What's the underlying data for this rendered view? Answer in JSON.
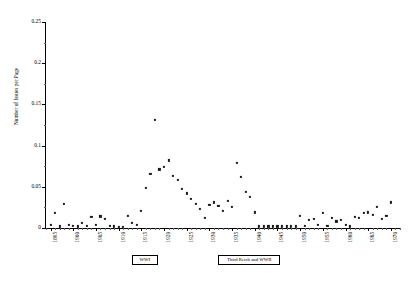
{
  "chart_data": {
    "type": "scatter",
    "title": "",
    "xlabel": "",
    "ylabel": "Number of Issues per Page",
    "xlim": [
      1894,
      1972
    ],
    "ylim": [
      0,
      0.25
    ],
    "grid": false,
    "legend": null,
    "y_ticks": [
      0,
      0.05,
      0.1,
      0.15,
      0.2,
      0.25
    ],
    "y_tick_labels": [
      "0",
      "0.05",
      "0.1",
      "0.15",
      "0.2",
      "0.25"
    ],
    "x_ticks": [
      1895,
      1900,
      1905,
      1910,
      1915,
      1920,
      1925,
      1930,
      1935,
      1940,
      1945,
      1950,
      1955,
      1960,
      1965,
      1970
    ],
    "x_tick_labels": [
      "1895",
      "1900",
      "1905",
      "1910",
      "1915",
      "1920",
      "1925",
      "1930",
      "1935",
      "1940",
      "1945",
      "1950",
      "1955",
      "1960",
      "1965",
      "1970"
    ],
    "x_minor_tick_step": 1,
    "marker": "square",
    "marker_color": "#1a1a1a",
    "marker_size": 2.2,
    "x": [
      1895,
      1896,
      1897,
      1898,
      1899,
      1900,
      1901,
      1902,
      1903,
      1904,
      1905,
      1906,
      1907,
      1908,
      1909,
      1910,
      1911,
      1912,
      1913,
      1914,
      1915,
      1916,
      1917,
      1918,
      1919,
      1920,
      1921,
      1922,
      1923,
      1924,
      1925,
      1926,
      1927,
      1928,
      1929,
      1930,
      1931,
      1932,
      1933,
      1934,
      1935,
      1936,
      1937,
      1938,
      1939,
      1940,
      1941,
      1942,
      1943,
      1944,
      1945,
      1946,
      1947,
      1948,
      1949,
      1950,
      1951,
      1952,
      1953,
      1954,
      1955,
      1956,
      1957,
      1958,
      1959,
      1960,
      1961,
      1962,
      1963,
      1964,
      1965,
      1966,
      1967,
      1968,
      1969,
      1970
    ],
    "y": [
      0.004,
      0.018,
      0.002,
      0.029,
      0.004,
      0.003,
      0.002,
      0.006,
      0.003,
      0.013,
      0.004,
      0.014,
      0.011,
      0.003,
      0.002,
      0.001,
      0.001,
      0.015,
      0.006,
      0.004,
      0.021,
      0.049,
      0.066,
      0.131,
      0.071,
      0.074,
      0.082,
      0.063,
      0.058,
      0.047,
      0.042,
      0.035,
      0.029,
      0.023,
      0.012,
      0.028,
      0.031,
      0.027,
      0.021,
      0.033,
      0.026,
      0.079,
      0.062,
      0.044,
      0.038,
      0.019,
      0.002,
      0.002,
      0.002,
      0.002,
      0.002,
      0.002,
      0.002,
      0.002,
      0.002,
      0.015,
      0.003,
      0.01,
      0.011,
      0.004,
      0.018,
      0.003,
      0.012,
      0.008,
      0.01,
      0.004,
      0.002,
      0.013,
      0.012,
      0.018,
      0.019,
      0.016,
      0.026,
      0.011,
      0.015,
      0.031
    ],
    "annotations": [
      {
        "label": "WWI",
        "x_start": 1914,
        "x_end": 1918
      },
      {
        "label": "Third Reich and WWII",
        "x_start": 1933,
        "x_end": 1945
      }
    ]
  }
}
